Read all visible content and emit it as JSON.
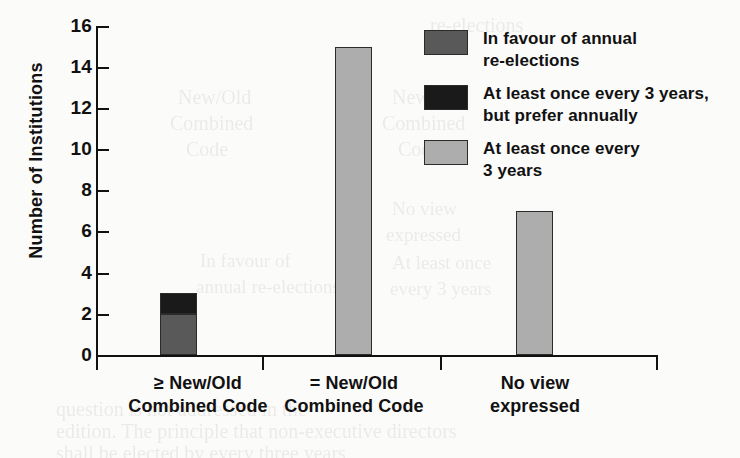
{
  "chart_data": {
    "type": "bar",
    "title": "",
    "xlabel": "",
    "ylabel": "Number of Institutions",
    "ylim": [
      0,
      16
    ],
    "ytick_step": 2,
    "yticks": [
      "16",
      "14",
      "12",
      "10",
      "8",
      "6",
      "4",
      "2",
      "0"
    ],
    "grid": false,
    "stacked": true,
    "legend_position": "top-right inside plot",
    "categories": [
      "≥ New/Old\nCombined\nCode",
      "= New/Old\nCombined\nCode",
      "No view\nexpressed"
    ],
    "series": [
      {
        "name": "In favour of annual\nre-elections",
        "color": "#595959",
        "values": [
          2,
          0,
          0
        ]
      },
      {
        "name": "At least once every 3 years,\nbut prefer annually",
        "color": "#1a1a1a",
        "values": [
          1,
          0,
          0
        ]
      },
      {
        "name": "At least once every\n3 years",
        "color": "#adadad",
        "values": [
          0,
          15,
          7
        ]
      }
    ],
    "category_totals": [
      3,
      15,
      7
    ]
  },
  "legend": {
    "items": [
      {
        "label": "In favour of annual\nre-elections",
        "color": "#595959"
      },
      {
        "label": "At least once every 3 years,\nbut prefer annually",
        "color": "#1a1a1a"
      },
      {
        "label": "At least once every\n3 years",
        "color": "#adadad"
      }
    ]
  },
  "axes": {
    "y_title": "Number of Institutions",
    "y_ticks": [
      "16",
      "14",
      "12",
      "10",
      "8",
      "6",
      "4",
      "2",
      "0"
    ],
    "x_ticks": [
      "≥ New/Old\nCombined\nCode",
      "= New/Old\nCombined\nCode",
      "No view\nexpressed"
    ]
  },
  "background_text": [
    "Code",
    "Combined",
    "New/Old",
    "expressed",
    "No view",
    "question is not addressed in the",
    "edition. The principle that non-executive directors",
    "shall be elected by",
    "every three years"
  ]
}
